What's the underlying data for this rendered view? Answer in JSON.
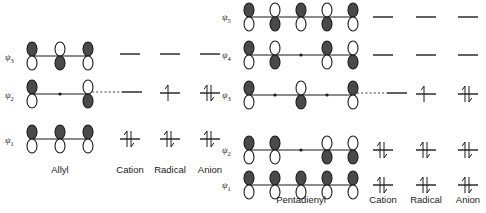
{
  "figure": {
    "background_color": "#ffffff",
    "ink_color": "#1a1a1a",
    "lobe_filled_color": "#4a4a4a",
    "lobe_open_color": "#ffffff"
  },
  "systems": [
    {
      "id": "allyl",
      "name": "Allyl",
      "p_orbital_count": 3,
      "charge_states": [
        "Cation",
        "Radical",
        "Anion"
      ],
      "orbitals": [
        {
          "label": "ψ3",
          "label_base": "ψ",
          "label_sub": "3",
          "lobes": [
            "up-open",
            "up-filled",
            "up-open"
          ],
          "node_dots": 2,
          "dashed_connector": false,
          "occupancy": {
            "Cation": 0,
            "Radical": 0,
            "Anion": 0
          }
        },
        {
          "label": "ψ2",
          "label_base": "ψ",
          "label_sub": "2",
          "lobes": [
            "up-open",
            "skip",
            "up-filled"
          ],
          "node_dots": 1,
          "dashed_connector": true,
          "occupancy": {
            "Cation": 0,
            "Radical": 1,
            "Anion": 2
          }
        },
        {
          "label": "ψ1",
          "label_base": "ψ",
          "label_sub": "1",
          "lobes": [
            "up-open",
            "up-open",
            "up-open"
          ],
          "node_dots": 0,
          "dashed_connector": false,
          "occupancy": {
            "Cation": 2,
            "Radical": 2,
            "Anion": 2
          }
        }
      ]
    },
    {
      "id": "pentadienyl",
      "name": "Pentadienyl",
      "p_orbital_count": 5,
      "charge_states": [
        "Cation",
        "Radical",
        "Anion"
      ],
      "orbitals": [
        {
          "label": "ψ5",
          "label_base": "ψ",
          "label_sub": "5",
          "lobes": [
            "up-open",
            "up-filled",
            "up-open",
            "up-filled",
            "up-open"
          ],
          "node_dots": 4,
          "dashed_connector": false,
          "occupancy": {
            "Cation": 0,
            "Radical": 0,
            "Anion": 0
          }
        },
        {
          "label": "ψ4",
          "label_base": "ψ",
          "label_sub": "4",
          "lobes": [
            "up-open",
            "up-filled",
            "skip",
            "up-filled",
            "up-open"
          ],
          "node_dots": 3,
          "dashed_connector": false,
          "occupancy": {
            "Cation": 0,
            "Radical": 0,
            "Anion": 0
          }
        },
        {
          "label": "ψ3",
          "label_base": "ψ",
          "label_sub": "3",
          "lobes": [
            "up-open",
            "skip",
            "up-filled",
            "skip",
            "up-open"
          ],
          "node_dots": 2,
          "dashed_connector": true,
          "occupancy": {
            "Cation": 0,
            "Radical": 1,
            "Anion": 2
          }
        },
        {
          "label": "ψ2",
          "label_base": "ψ",
          "label_sub": "2",
          "lobes": [
            "up-open",
            "up-open",
            "skip",
            "up-filled",
            "up-filled"
          ],
          "node_dots": 1,
          "dashed_connector": false,
          "occupancy": {
            "Cation": 2,
            "Radical": 2,
            "Anion": 2
          }
        },
        {
          "label": "ψ1",
          "label_base": "ψ",
          "label_sub": "1",
          "lobes": [
            "up-open",
            "up-open",
            "up-open",
            "up-open",
            "up-open"
          ],
          "node_dots": 0,
          "dashed_connector": false,
          "occupancy": {
            "Cation": 2,
            "Radical": 2,
            "Anion": 2
          }
        }
      ]
    }
  ],
  "captions": {
    "allyl_system": "Allyl",
    "pentadienyl_system": "Pentadienyl",
    "cation": "Cation",
    "radical": "Radical",
    "anion": "Anion"
  }
}
